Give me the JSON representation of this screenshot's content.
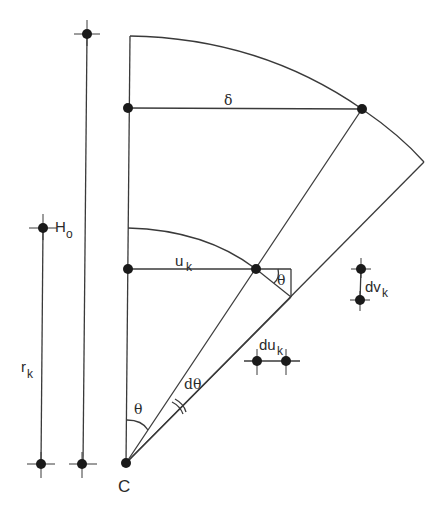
{
  "diagram": {
    "labels": {
      "H_base": "H",
      "H_sub": "o",
      "r_base": "r",
      "r_sub": "k",
      "delta": "δ",
      "u_base": "u",
      "u_sub": "k",
      "theta_small": "θ",
      "theta_bottom": "θ",
      "dtheta": "dθ",
      "dv_base": "dv",
      "dv_sub": "k",
      "du_base": "du",
      "du_sub": "k",
      "center": "C"
    }
  }
}
